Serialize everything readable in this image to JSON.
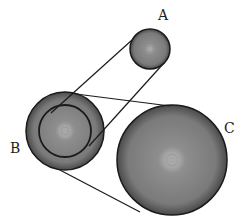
{
  "diagram": {
    "type": "belt-pulley-system",
    "colors": {
      "background": "#ffffff",
      "stroke": "#1a1a1a",
      "pulley_center": "#b5b5b5",
      "pulley_edge": "#5a5a5a",
      "hub": "#a8a8a8"
    },
    "pulleys": [
      {
        "id": "A",
        "label": "A",
        "cx": 150,
        "cy": 49,
        "r": 20,
        "hub_r": 3,
        "label_x": 158,
        "label_y": 20
      },
      {
        "id": "B",
        "label": "B",
        "cx": 65,
        "cy": 131,
        "r": 39,
        "inner_r": 26,
        "hub_r": 4,
        "label_x": 10,
        "label_y": 153
      },
      {
        "id": "C",
        "label": "C",
        "cx": 172,
        "cy": 160,
        "r": 55,
        "hub_r": 6,
        "label_x": 224,
        "label_y": 133
      }
    ],
    "belts": [
      {
        "name": "belt-A-to-B-inner",
        "lines": [
          [
            132,
            40,
            51,
            113
          ],
          [
            163,
            64,
            89,
            146
          ]
        ]
      },
      {
        "name": "belt-B-outer-to-C",
        "lines": [
          [
            76,
            94,
            170,
            106
          ],
          [
            58,
            169,
            140,
            212
          ]
        ]
      }
    ]
  }
}
